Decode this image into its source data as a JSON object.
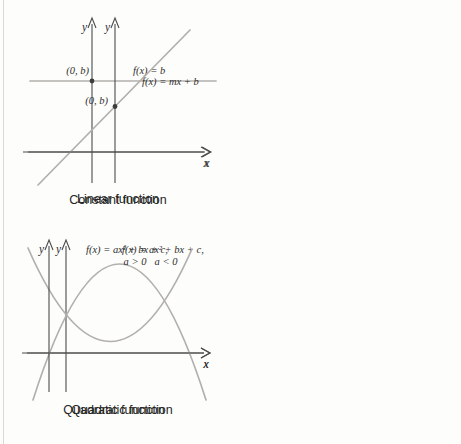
{
  "colors": {
    "background": "#fdfdfb",
    "curve": "#b2b0ad",
    "axis": "#4c4c4c",
    "point": "#3d3d3d",
    "text": "#2f2f2f",
    "caption": "#262626",
    "page-edge": "#d8d8d4"
  },
  "panels": [
    {
      "caption": "Constant function",
      "equation": "f(x) = b",
      "point_label": "(0, b)",
      "x_label": "x",
      "y_label": "y"
    },
    {
      "caption": "Linear function",
      "equation": "f(x) = mx + b",
      "point_label": "(0, b)",
      "x_label": "x",
      "y_label": "y"
    },
    {
      "caption": "Quadratic function",
      "equation": "f(x) = ax² + bx + c,",
      "condition": "a < 0",
      "x_label": "x",
      "y_label": "y"
    },
    {
      "caption": "Quadratic function",
      "equation": "f(x) = ax² + bx + c,",
      "condition": "a > 0",
      "x_label": "x",
      "y_label": "y"
    }
  ]
}
